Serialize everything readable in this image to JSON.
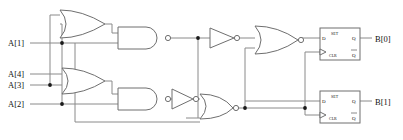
{
  "diagram": {
    "type": "digital-logic-schematic",
    "colors": {
      "background": "#ffffff",
      "wire": "#8a8a8a",
      "gate_outline": "#6f6f6f",
      "text": "#111111",
      "junction": "#1a1a1a"
    },
    "inputs": [
      {
        "id": "a1",
        "label": "A[1]",
        "y": 43
      },
      {
        "id": "a4",
        "label": "A[4]",
        "y": 74
      },
      {
        "id": "a3",
        "label": "A[3]",
        "y": 85
      },
      {
        "id": "a2",
        "label": "A[2]",
        "y": 104
      }
    ],
    "outputs": [
      {
        "id": "b0",
        "label": "B[0]",
        "y": 39
      },
      {
        "id": "b1",
        "label": "B[1]",
        "y": 102
      }
    ],
    "gates": [
      {
        "id": "or1",
        "type": "OR",
        "x": 60,
        "y": 10
      },
      {
        "id": "nand1",
        "type": "NAND",
        "x": 118,
        "y": 27
      },
      {
        "id": "or2",
        "type": "OR",
        "x": 62,
        "y": 68
      },
      {
        "id": "nand2",
        "type": "NAND",
        "x": 118,
        "y": 88
      },
      {
        "id": "inv1",
        "type": "INVERTER",
        "x": 210,
        "y": 28
      },
      {
        "id": "inv2",
        "type": "INVERTER",
        "x": 172,
        "y": 89
      },
      {
        "id": "nor1",
        "type": "NOR",
        "x": 255,
        "y": 26
      },
      {
        "id": "nor2",
        "type": "NOR",
        "x": 200,
        "y": 88
      }
    ],
    "flipflops": [
      {
        "id": "ff0",
        "type": "D flip-flop",
        "pins": {
          "d": "D",
          "set": "SET",
          "q": "Q",
          "clr": "CLR",
          "qbar": "Q"
        },
        "x": 320,
        "y": 28,
        "w": 40,
        "h": 32
      },
      {
        "id": "ff1",
        "type": "D flip-flop",
        "pins": {
          "d": "D",
          "set": "SET",
          "q": "Q",
          "clr": "CLR",
          "qbar": "Q"
        },
        "x": 320,
        "y": 91,
        "w": 40,
        "h": 32
      }
    ]
  }
}
